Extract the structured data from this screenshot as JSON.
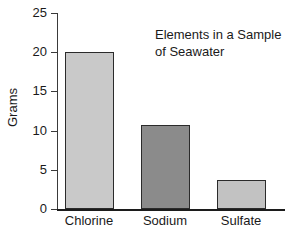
{
  "chart_data": {
    "type": "bar",
    "title": "Elements in a Sample of Seawater",
    "title_lines": [
      "Elements in a Sample",
      "of Seawater"
    ],
    "categories": [
      "Chlorine",
      "Sodium",
      "Sulfate"
    ],
    "values": [
      20.0,
      10.7,
      3.7
    ],
    "bar_colors": [
      "#c9c9c9",
      "#8b8b8b",
      "#c2c2c2"
    ],
    "bar_border_color": "#2b2b2b",
    "xlabel": "",
    "ylabel": "Grams",
    "ylim": [
      0,
      25
    ],
    "yticks": [
      0,
      5,
      10,
      15,
      20,
      25
    ],
    "ytick_labels": [
      "0",
      "5",
      "10",
      "15",
      "20",
      "25"
    ],
    "grid": false,
    "legend": false,
    "background": "#ffffff",
    "axis_color": "#1c1c1c",
    "text_color": "#1a1a1a"
  }
}
